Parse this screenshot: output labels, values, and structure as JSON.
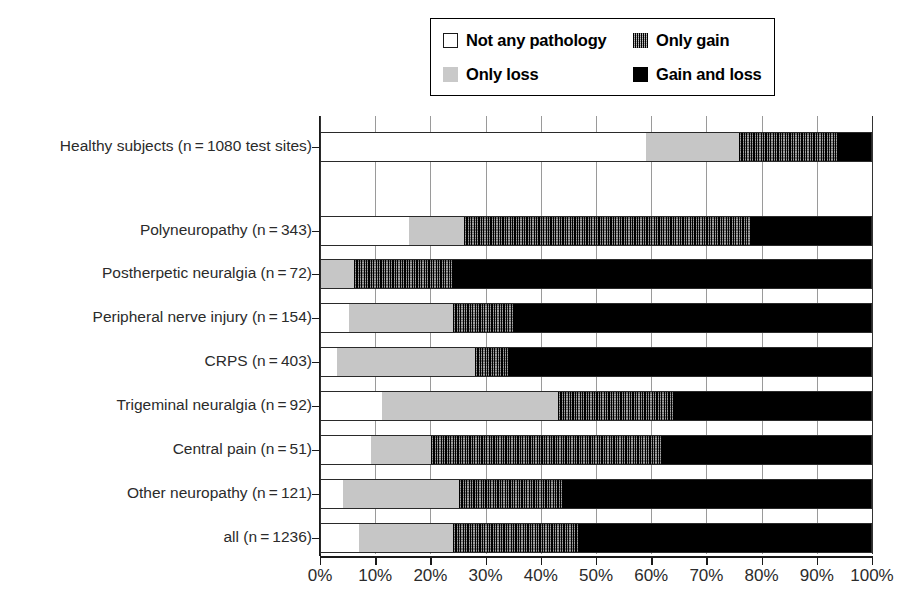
{
  "legend": {
    "items": [
      {
        "key": "none",
        "label": "Not any pathology",
        "swatch": "swatch-white-outline"
      },
      {
        "key": "gain",
        "label": "Only gain",
        "swatch": "swatch-hatched-dark"
      },
      {
        "key": "loss",
        "label": "Only loss",
        "swatch": "swatch-light-gray"
      },
      {
        "key": "both",
        "label": "Gain and loss",
        "swatch": "swatch-solid-black"
      }
    ]
  },
  "chart_data": {
    "type": "bar",
    "orientation": "horizontal",
    "stacked": true,
    "stack_mode": "percent",
    "title": "",
    "xlabel": "",
    "ylabel": "",
    "xlim": [
      0,
      100
    ],
    "xtick_labels": [
      "0%",
      "10%",
      "20%",
      "30%",
      "40%",
      "50%",
      "60%",
      "70%",
      "80%",
      "90%",
      "100%"
    ],
    "xticks": [
      0,
      10,
      20,
      30,
      40,
      50,
      60,
      70,
      80,
      90,
      100
    ],
    "grid": "vertical",
    "legend_position": "top-right",
    "categories": [
      "Healthy subjects (n = 1080 test sites)",
      "Polyneuropathy (n = 343)",
      "Postherpetic neuralgia (n = 72)",
      "Peripheral nerve injury (n = 154)",
      "CRPS (n = 403)",
      "Trigeminal neuralgia (n = 92)",
      "Central pain (n = 51)",
      "Other neuropathy (n = 121)",
      "all (n = 1236)"
    ],
    "series": [
      {
        "name": "Not any pathology",
        "key": "none",
        "color": "#ffffff",
        "values": [
          59,
          16,
          0,
          5,
          3,
          11,
          9,
          4,
          7
        ]
      },
      {
        "name": "Only loss",
        "key": "loss",
        "color": "#c6c6c6",
        "values": [
          17,
          10,
          6,
          19,
          25,
          32,
          11,
          21,
          17
        ]
      },
      {
        "name": "Only gain",
        "key": "gain",
        "color": "#262626",
        "values": [
          18,
          52,
          18,
          11,
          6,
          21,
          42,
          19,
          23
        ]
      },
      {
        "name": "Gain and loss",
        "key": "both",
        "color": "#000000",
        "values": [
          6,
          22,
          76,
          65,
          66,
          36,
          38,
          56,
          53
        ]
      }
    ]
  }
}
